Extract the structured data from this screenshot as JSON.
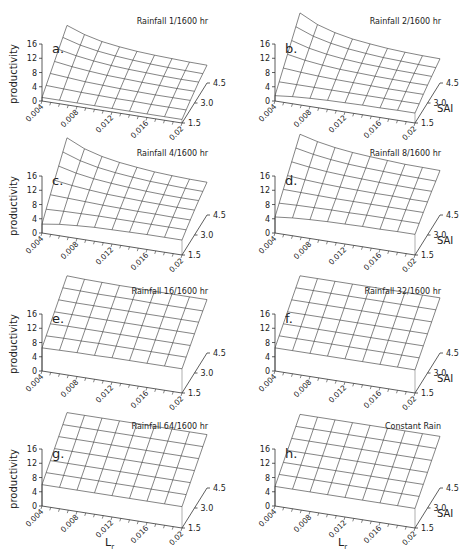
{
  "figure": {
    "zlabel": "productivity",
    "xlabel_main": "L",
    "xlabel_sub": "r",
    "ylabel": "SAI"
  },
  "chart_data": [
    {
      "type": "surface",
      "panel": "a.",
      "title": "Rainfall 1/1600 hr",
      "x": [
        0.004,
        0.006,
        0.008,
        0.01,
        0.012,
        0.014,
        0.016,
        0.018,
        0.02
      ],
      "y": [
        1.5,
        2.0,
        2.5,
        3.0,
        3.5,
        4.0,
        4.5
      ],
      "xticks": [
        "0.004",
        "0.008",
        "0.012",
        "0.016",
        "0.02"
      ],
      "yticks": [
        "1.5",
        "3.0",
        "4.5"
      ],
      "zticks": [
        "0",
        "4",
        "8",
        "12",
        "16"
      ],
      "zlim": [
        0,
        16
      ],
      "z": [
        [
          1.0,
          1.0,
          1.0,
          1.0,
          1.0,
          1.0,
          1.0,
          1.0,
          1.0
        ],
        [
          2.5,
          2.3,
          2.1,
          2.0,
          1.9,
          1.9,
          1.8,
          1.8,
          1.8
        ],
        [
          4.0,
          3.6,
          3.2,
          3.0,
          2.8,
          2.7,
          2.6,
          2.6,
          2.6
        ],
        [
          5.5,
          4.8,
          4.3,
          3.9,
          3.7,
          3.5,
          3.4,
          3.3,
          3.3
        ],
        [
          7.0,
          6.0,
          5.3,
          4.8,
          4.5,
          4.3,
          4.1,
          4.0,
          4.0
        ],
        [
          8.5,
          7.1,
          6.2,
          5.6,
          5.2,
          4.9,
          4.7,
          4.6,
          4.5
        ],
        [
          10.0,
          8.2,
          7.0,
          6.3,
          5.8,
          5.5,
          5.3,
          5.1,
          5.0
        ]
      ],
      "show_sai_label": false,
      "show_zlabel": true,
      "show_xlabel": false
    },
    {
      "type": "surface",
      "panel": "b.",
      "title": "Rainfall 2/1600 hr",
      "x": [
        0.004,
        0.006,
        0.008,
        0.01,
        0.012,
        0.014,
        0.016,
        0.018,
        0.02
      ],
      "y": [
        1.5,
        2.0,
        2.5,
        3.0,
        3.5,
        4.0,
        4.5
      ],
      "xticks": [
        "0.004",
        "0.008",
        "0.012",
        "0.016",
        "0.02"
      ],
      "yticks": [
        "1.5",
        "3.0",
        "4.5"
      ],
      "zticks": [
        "0",
        "4",
        "8",
        "12",
        "16"
      ],
      "zlim": [
        0,
        16
      ],
      "z": [
        [
          1.5,
          2.0,
          2.3,
          2.5,
          2.6,
          2.7,
          2.7,
          2.8,
          2.8
        ],
        [
          3.5,
          3.5,
          3.5,
          3.5,
          3.5,
          3.5,
          3.5,
          3.5,
          3.5
        ],
        [
          5.5,
          5.1,
          4.8,
          4.6,
          4.5,
          4.4,
          4.3,
          4.3,
          4.3
        ],
        [
          7.5,
          6.6,
          6.0,
          5.6,
          5.4,
          5.2,
          5.1,
          5.0,
          5.0
        ],
        [
          9.5,
          8.1,
          7.2,
          6.6,
          6.2,
          6.0,
          5.8,
          5.7,
          5.6
        ],
        [
          11.5,
          9.6,
          8.4,
          7.6,
          7.1,
          6.7,
          6.5,
          6.3,
          6.2
        ],
        [
          13.5,
          11.0,
          9.5,
          8.5,
          7.9,
          7.4,
          7.1,
          6.9,
          6.8
        ]
      ],
      "show_sai_label": true,
      "show_zlabel": false,
      "show_xlabel": false
    },
    {
      "type": "surface",
      "panel": "c.",
      "title": "Rainfall 4/1600 hr",
      "x": [
        0.004,
        0.006,
        0.008,
        0.01,
        0.012,
        0.014,
        0.016,
        0.018,
        0.02
      ],
      "y": [
        1.5,
        2.0,
        2.5,
        3.0,
        3.5,
        4.0,
        4.5
      ],
      "xticks": [
        "0.004",
        "0.008",
        "0.012",
        "0.016",
        "0.02"
      ],
      "yticks": [
        "1.5",
        "3.0",
        "4.5"
      ],
      "zticks": [
        "0",
        "4",
        "8",
        "12",
        "16"
      ],
      "zlim": [
        0,
        16
      ],
      "z": [
        [
          2.5,
          3.2,
          3.6,
          3.9,
          4.0,
          4.1,
          4.2,
          4.2,
          4.2
        ],
        [
          4.8,
          5.0,
          5.1,
          5.2,
          5.2,
          5.2,
          5.2,
          5.2,
          5.2
        ],
        [
          7.0,
          6.8,
          6.6,
          6.4,
          6.3,
          6.2,
          6.2,
          6.1,
          6.1
        ],
        [
          9.2,
          8.5,
          8.0,
          7.6,
          7.4,
          7.2,
          7.1,
          7.0,
          7.0
        ],
        [
          11.3,
          10.1,
          9.3,
          8.8,
          8.4,
          8.1,
          7.9,
          7.8,
          7.8
        ],
        [
          13.4,
          11.7,
          10.6,
          9.9,
          9.4,
          9.0,
          8.8,
          8.6,
          8.5
        ],
        [
          15.5,
          13.2,
          11.8,
          10.9,
          10.3,
          9.8,
          9.5,
          9.3,
          9.2
        ]
      ],
      "show_sai_label": false,
      "show_zlabel": true,
      "show_xlabel": false
    },
    {
      "type": "surface",
      "panel": "d.",
      "title": "Rainfall 8/1600 hr",
      "x": [
        0.004,
        0.006,
        0.008,
        0.01,
        0.012,
        0.014,
        0.016,
        0.018,
        0.02
      ],
      "y": [
        1.5,
        2.0,
        2.5,
        3.0,
        3.5,
        4.0,
        4.5
      ],
      "xticks": [
        "0.004",
        "0.008",
        "0.012",
        "0.016",
        "0.02"
      ],
      "yticks": [
        "1.5",
        "3.0",
        "4.5"
      ],
      "zticks": [
        "0",
        "4",
        "8",
        "12",
        "16"
      ],
      "zlim": [
        0,
        16
      ],
      "z": [
        [
          4.5,
          5.0,
          5.3,
          5.5,
          5.6,
          5.7,
          5.7,
          5.8,
          5.8
        ],
        [
          6.5,
          6.7,
          6.8,
          6.9,
          6.9,
          7.0,
          7.0,
          7.0,
          7.0
        ],
        [
          8.5,
          8.4,
          8.3,
          8.2,
          8.2,
          8.2,
          8.2,
          8.2,
          8.2
        ],
        [
          10.5,
          10.1,
          9.8,
          9.6,
          9.5,
          9.4,
          9.4,
          9.3,
          9.3
        ],
        [
          12.5,
          11.8,
          11.3,
          11.0,
          10.8,
          10.6,
          10.5,
          10.4,
          10.4
        ],
        [
          14.5,
          13.5,
          12.8,
          12.3,
          12.0,
          11.8,
          11.6,
          11.5,
          11.4
        ],
        [
          16.5,
          15.2,
          14.3,
          13.7,
          13.3,
          13.0,
          12.7,
          12.6,
          12.5
        ]
      ],
      "show_sai_label": true,
      "show_zlabel": false,
      "show_xlabel": false
    },
    {
      "type": "surface",
      "panel": "e.",
      "title": "Rainfall 16/1600 hr",
      "x": [
        0.004,
        0.006,
        0.008,
        0.01,
        0.012,
        0.014,
        0.016,
        0.018,
        0.02
      ],
      "y": [
        1.5,
        2.0,
        2.5,
        3.0,
        3.5,
        4.0,
        4.5
      ],
      "xticks": [
        "0.004",
        "0.008",
        "0.012",
        "0.016",
        "0.02"
      ],
      "yticks": [
        "1.5",
        "3.0",
        "4.5"
      ],
      "zticks": [
        "0",
        "4",
        "8",
        "12",
        "16"
      ],
      "zlim": [
        0,
        16
      ],
      "z": [
        [
          6.5,
          6.6,
          6.7,
          6.7,
          6.8,
          6.8,
          6.8,
          6.8,
          6.8
        ],
        [
          8.0,
          8.1,
          8.1,
          8.2,
          8.2,
          8.2,
          8.2,
          8.2,
          8.2
        ],
        [
          9.5,
          9.6,
          9.6,
          9.6,
          9.6,
          9.6,
          9.6,
          9.6,
          9.6
        ],
        [
          11.0,
          11.0,
          11.0,
          11.0,
          11.0,
          11.0,
          11.0,
          11.0,
          11.0
        ],
        [
          12.5,
          12.4,
          12.4,
          12.4,
          12.4,
          12.4,
          12.4,
          12.4,
          12.4
        ],
        [
          14.0,
          13.9,
          13.8,
          13.8,
          13.8,
          13.7,
          13.7,
          13.7,
          13.7
        ],
        [
          15.5,
          15.3,
          15.2,
          15.1,
          15.1,
          15.0,
          15.0,
          15.0,
          15.0
        ]
      ],
      "show_sai_label": false,
      "show_zlabel": true,
      "show_xlabel": false
    },
    {
      "type": "surface",
      "panel": "f.",
      "title": "Rainfall 32/1600 hr",
      "x": [
        0.004,
        0.006,
        0.008,
        0.01,
        0.012,
        0.014,
        0.016,
        0.018,
        0.02
      ],
      "y": [
        1.5,
        2.0,
        2.5,
        3.0,
        3.5,
        4.0,
        4.5
      ],
      "xticks": [
        "0.004",
        "0.008",
        "0.012",
        "0.016",
        "0.02"
      ],
      "yticks": [
        "1.5",
        "3.0",
        "4.5"
      ],
      "zticks": [
        "0",
        "4",
        "8",
        "12",
        "16"
      ],
      "zlim": [
        0,
        16
      ],
      "z": [
        [
          6.5,
          6.5,
          6.5,
          6.5,
          6.5,
          6.5,
          6.5,
          6.5,
          6.5
        ],
        [
          8.0,
          8.0,
          8.0,
          8.0,
          8.0,
          8.0,
          8.0,
          8.0,
          8.0
        ],
        [
          9.5,
          9.5,
          9.5,
          9.5,
          9.5,
          9.5,
          9.5,
          9.5,
          9.5
        ],
        [
          11.0,
          11.0,
          11.0,
          11.0,
          11.0,
          11.0,
          11.0,
          11.0,
          11.0
        ],
        [
          12.5,
          12.5,
          12.5,
          12.5,
          12.5,
          12.5,
          12.5,
          12.5,
          12.5
        ],
        [
          14.0,
          14.0,
          14.0,
          14.0,
          14.0,
          14.0,
          14.0,
          14.0,
          14.0
        ],
        [
          15.5,
          15.5,
          15.5,
          15.5,
          15.5,
          15.5,
          15.5,
          15.5,
          15.5
        ]
      ],
      "show_sai_label": true,
      "show_zlabel": false,
      "show_xlabel": false
    },
    {
      "type": "surface",
      "panel": "g.",
      "title": "Rainfall 64/1600 hr",
      "x": [
        0.004,
        0.006,
        0.008,
        0.01,
        0.012,
        0.014,
        0.016,
        0.018,
        0.02
      ],
      "y": [
        1.5,
        2.0,
        2.5,
        3.0,
        3.5,
        4.0,
        4.5
      ],
      "xticks": [
        "0.004",
        "0.008",
        "0.012",
        "0.016",
        "0.02"
      ],
      "yticks": [
        "1.5",
        "3.0",
        "4.5"
      ],
      "zticks": [
        "0",
        "4",
        "8",
        "12",
        "16"
      ],
      "zlim": [
        0,
        16
      ],
      "z": [
        [
          6.0,
          6.0,
          6.0,
          6.0,
          6.0,
          6.0,
          6.0,
          6.0,
          6.0
        ],
        [
          7.5,
          7.5,
          7.5,
          7.5,
          7.5,
          7.5,
          7.5,
          7.5,
          7.5
        ],
        [
          9.0,
          9.0,
          9.0,
          9.0,
          9.0,
          9.0,
          9.0,
          9.0,
          9.0
        ],
        [
          10.5,
          10.5,
          10.5,
          10.5,
          10.5,
          10.5,
          10.5,
          10.5,
          10.5
        ],
        [
          12.0,
          12.0,
          12.0,
          12.0,
          12.0,
          12.0,
          12.0,
          12.0,
          12.0
        ],
        [
          13.5,
          13.5,
          13.5,
          13.5,
          13.5,
          13.5,
          13.5,
          13.5,
          13.5
        ],
        [
          15.0,
          15.0,
          15.0,
          15.0,
          15.0,
          15.0,
          15.0,
          15.0,
          15.0
        ]
      ],
      "show_sai_label": false,
      "show_zlabel": true,
      "show_xlabel": true
    },
    {
      "type": "surface",
      "panel": "h.",
      "title": "Constant Rain",
      "x": [
        0.004,
        0.006,
        0.008,
        0.01,
        0.012,
        0.014,
        0.016,
        0.018,
        0.02
      ],
      "y": [
        1.5,
        2.0,
        2.5,
        3.0,
        3.5,
        4.0,
        4.5
      ],
      "xticks": [
        "0.004",
        "0.008",
        "0.012",
        "0.016",
        "0.02"
      ],
      "yticks": [
        "1.5",
        "3.0",
        "4.5"
      ],
      "zticks": [
        "0",
        "4",
        "8",
        "12",
        "16"
      ],
      "zlim": [
        0,
        16
      ],
      "z": [
        [
          5.5,
          5.5,
          5.5,
          5.5,
          5.5,
          5.5,
          5.5,
          5.5,
          5.5
        ],
        [
          7.0,
          7.0,
          7.0,
          7.0,
          7.0,
          7.0,
          7.0,
          7.0,
          7.0
        ],
        [
          8.5,
          8.5,
          8.5,
          8.5,
          8.5,
          8.5,
          8.5,
          8.5,
          8.5
        ],
        [
          10.0,
          10.0,
          10.0,
          10.0,
          10.0,
          10.0,
          10.0,
          10.0,
          10.0
        ],
        [
          11.5,
          11.5,
          11.5,
          11.5,
          11.5,
          11.5,
          11.5,
          11.5,
          11.5
        ],
        [
          13.0,
          13.0,
          13.0,
          13.0,
          13.0,
          13.0,
          13.0,
          13.0,
          13.0
        ],
        [
          14.5,
          14.5,
          14.5,
          14.5,
          14.5,
          14.5,
          14.5,
          14.5,
          14.5
        ]
      ],
      "show_sai_label": true,
      "show_zlabel": false,
      "show_xlabel": true
    }
  ],
  "layout": {
    "panel_origins": [
      [
        0,
        0
      ],
      [
        233,
        0
      ],
      [
        0,
        132
      ],
      [
        233,
        132
      ],
      [
        0,
        270
      ],
      [
        233,
        270
      ],
      [
        0,
        405
      ],
      [
        233,
        405
      ]
    ],
    "line_color": "#333333",
    "text_color": "#222222"
  }
}
